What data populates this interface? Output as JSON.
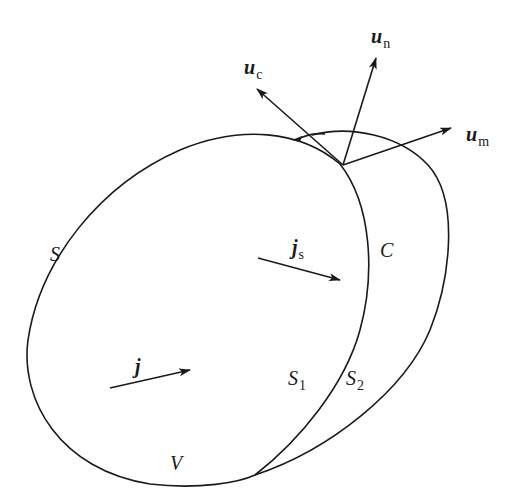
{
  "diagram": {
    "colors": {
      "stroke": "#1a1a1a",
      "background": "#ffffff"
    },
    "labels": {
      "u_c": {
        "main": "u",
        "sub": "c"
      },
      "u_n": {
        "main": "u",
        "sub": "n"
      },
      "u_m": {
        "main": "u",
        "sub": "m"
      },
      "S": "S",
      "C": "C",
      "j_s": {
        "main": "j",
        "sub": "s"
      },
      "j": "j",
      "S1": {
        "main": "S",
        "sub": "1"
      },
      "S2": {
        "main": "S",
        "sub": "2"
      },
      "V": "V"
    },
    "vectors": [
      {
        "name": "u_c",
        "from": [
          343,
          165
        ],
        "to": [
          256,
          88
        ]
      },
      {
        "name": "u_n",
        "from": [
          343,
          165
        ],
        "to": [
          376,
          57
        ]
      },
      {
        "name": "u_m",
        "from": [
          343,
          165
        ],
        "to": [
          452,
          128
        ]
      },
      {
        "name": "j_s",
        "from": [
          258,
          258
        ],
        "to": [
          340,
          280
        ]
      },
      {
        "name": "j",
        "from": [
          110,
          388
        ],
        "to": [
          190,
          370
        ]
      }
    ]
  }
}
